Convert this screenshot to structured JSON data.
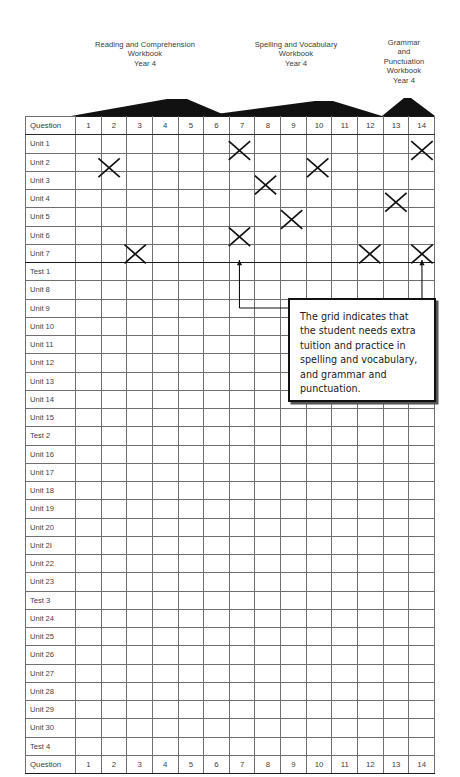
{
  "header": {
    "groups": [
      {
        "id": "reading",
        "title": "Reading and Comprehension\nWorkbook\nYear 4",
        "columns": [
          1,
          2,
          3,
          4,
          5,
          6
        ]
      },
      {
        "id": "spelling",
        "title": "Spelling and Vocabulary\nWorkbook\nYear 4",
        "columns": [
          6,
          7,
          8,
          9,
          10,
          11,
          12
        ]
      },
      {
        "id": "grammar",
        "title": "Grammar\nand\nPunctuation\nWorkbook\nYear 4",
        "columns": [
          13,
          14
        ]
      }
    ]
  },
  "grid": {
    "corner_label": "Question",
    "columns": [
      "1",
      "2",
      "3",
      "4",
      "5",
      "6",
      "7",
      "8",
      "9",
      "10",
      "11",
      "12",
      "13",
      "14"
    ],
    "rows": [
      "Unit 1",
      "Unit 2",
      "Unit 3",
      "Unit 4",
      "Unit 5",
      "Unit 6",
      "Unit 7",
      "Test 1",
      "Unit 8",
      "Unit 9",
      "Unit 10",
      "Unit 11",
      "Unit 12",
      "Unit 13",
      "Unit 14",
      "Unit 15",
      "Test 2",
      "Unit 16",
      "Unit 17",
      "Unit 18",
      "Unit 19",
      "Unit 20",
      "Unit 2I",
      "Unit 22",
      "Unit 23",
      "Test 3",
      "Unit 24",
      "Unit 25",
      "Unit 26",
      "Unit 27",
      "Unit 28",
      "Unit 29",
      "Unit 30",
      "Test 4"
    ],
    "footer_label": "Question",
    "thick_divider_after_rows": [
      "Unit 7"
    ],
    "marks": [
      {
        "symbol": "X",
        "column": 7,
        "row_boundary": "Unit 1"
      },
      {
        "symbol": "X",
        "column": 14,
        "row_boundary": "Unit 1"
      },
      {
        "symbol": "X",
        "column": 2,
        "row_boundary": "Unit 2"
      },
      {
        "symbol": "X",
        "column": 10,
        "row_boundary": "Unit 2"
      },
      {
        "symbol": "X",
        "column": 8,
        "row_boundary": "Unit 3"
      },
      {
        "symbol": "X",
        "column": 13,
        "row_boundary": "Unit 4"
      },
      {
        "symbol": "X",
        "column": 9,
        "row_boundary": "Unit 5"
      },
      {
        "symbol": "X",
        "column": 7,
        "row_boundary": "Unit 6"
      },
      {
        "symbol": "X",
        "column": 3,
        "row_boundary": "Unit 7"
      },
      {
        "symbol": "X",
        "column": 12,
        "row_boundary": "Unit 7"
      },
      {
        "symbol": "X",
        "column": 14,
        "row_boundary": "Unit 7"
      }
    ]
  },
  "callout": {
    "text": "The grid indicates that the student needs extra tuition and practice in spelling and vocabulary, and grammar and punctuation.",
    "leaders": [
      {
        "from_column": 7,
        "from_row": "Unit 7",
        "style": "elbow-right"
      },
      {
        "from_column": 14,
        "from_row": "Unit 7",
        "style": "straight-down"
      }
    ]
  },
  "colors": {
    "grid_line": "#6f6f6f",
    "grid_line_thick": "#1a1a1a",
    "text": "#3f3f3f",
    "header_text": "#3a3a3a",
    "mark": "#111111",
    "callout_border": "#111111",
    "callout_shadow": "#555555",
    "bracket_fill": "#111111",
    "page_background": "#ffffff"
  }
}
